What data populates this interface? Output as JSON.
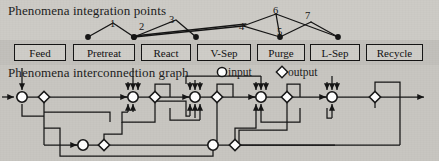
{
  "diagram": {
    "top_section_title": "Phenomena integration points",
    "bottom_section_title": "Phenomena interconnection graph",
    "legend": {
      "input_symbol": "circle-symbol",
      "input_label": "input",
      "output_symbol": "diamond-symbol",
      "output_label": "output"
    },
    "unit_boxes": [
      {
        "label": "Feed",
        "x": 14,
        "w": 52
      },
      {
        "label": "Pretreat",
        "x": 73,
        "w": 62
      },
      {
        "label": "React",
        "x": 141,
        "w": 50
      },
      {
        "label": "V-Sep",
        "x": 197,
        "w": 54
      },
      {
        "label": "Purge",
        "x": 257,
        "w": 48
      },
      {
        "label": "L-Sep",
        "x": 310,
        "w": 50
      },
      {
        "label": "Recycle",
        "x": 366,
        "w": 57
      },
      {
        "label": "Output",
        "x": 440,
        "w": 54
      }
    ],
    "integration_point_labels": [
      "1",
      "2",
      "3",
      "4",
      "5",
      "6",
      "7"
    ],
    "integration_points": [
      {
        "id": "1",
        "label_x": 110,
        "label_y": 19
      },
      {
        "id": "2",
        "label_x": 139,
        "label_y": 22
      },
      {
        "id": "3",
        "label_x": 169,
        "label_y": 15
      },
      {
        "id": "4",
        "label_x": 239,
        "label_y": 22
      },
      {
        "id": "5",
        "label_x": 277,
        "label_y": 27
      },
      {
        "id": "6",
        "label_x": 273,
        "label_y": 6
      },
      {
        "id": "7",
        "label_x": 305,
        "label_y": 11
      }
    ],
    "colors": {
      "background": "#c9c7c2",
      "ink": "#141414",
      "node_fill": "#ffffff",
      "box_fill": "#cfcdc8"
    }
  },
  "chart_data": {
    "type": "diagram",
    "integration_dots": [
      {
        "x": 88,
        "y": 37
      },
      {
        "x": 134,
        "y": 37
      },
      {
        "x": 196,
        "y": 37
      },
      {
        "x": 280,
        "y": 37
      },
      {
        "x": 338,
        "y": 37
      }
    ],
    "graph_input_nodes_main": [
      22,
      133,
      195,
      261,
      332
    ],
    "graph_output_nodes_main": [
      44,
      155,
      217,
      287,
      375
    ],
    "graph_input_nodes_lower": [
      83,
      213
    ],
    "graph_output_nodes_lower": [
      104,
      235
    ],
    "main_row_y": 97,
    "lower_row_y": 145
  }
}
